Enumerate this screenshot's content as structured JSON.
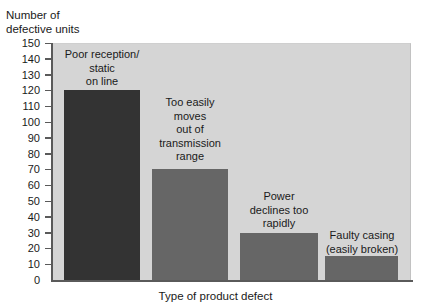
{
  "chart_data": {
    "type": "bar",
    "title": "",
    "xlabel": "Type of product defect",
    "ylabel": "Number of\ndefective units",
    "categories": [
      "Poor reception/\nstatic\non line",
      "Too easily\nmoves\nout of\ntransmission\nrange",
      "Power\ndeclines too\nrapidly",
      "Faulty casing\n(easily broken)"
    ],
    "values": [
      120,
      70,
      30,
      15
    ],
    "ylim": [
      0,
      150
    ],
    "ytick_step": 10,
    "yticks": [
      0,
      10,
      20,
      30,
      40,
      50,
      60,
      70,
      80,
      90,
      100,
      110,
      120,
      130,
      140,
      150
    ],
    "ytick_labels": [
      "0",
      "10",
      "20",
      "30",
      "40",
      "50",
      "60",
      "70",
      "80",
      "90",
      "100",
      "110",
      "120",
      "130",
      "140",
      "150"
    ],
    "grid": false,
    "legend": false,
    "bar_colors": [
      "#333333",
      "#666666",
      "#666666",
      "#666666"
    ],
    "plot_background": "#d5d5d5",
    "axis_color": "#5a5a5a"
  },
  "bars": [
    {
      "category": "Poor reception/\nstatic\non line",
      "value": 120,
      "color": "#333333",
      "left_px": 64,
      "width_px": 76,
      "label_left_px": 56,
      "label_top_px": 48,
      "label_width_px": 92
    },
    {
      "category": "Too easily\nmoves\nout of\ntransmission\nrange",
      "value": 70,
      "color": "#666666",
      "left_px": 152,
      "width_px": 76,
      "label_left_px": 144,
      "label_top_px": 96,
      "label_width_px": 92
    },
    {
      "category": "Power\ndeclines too\nrapidly",
      "value": 30,
      "color": "#666666",
      "left_px": 240,
      "width_px": 78,
      "label_left_px": 232,
      "label_top_px": 190,
      "label_width_px": 94
    },
    {
      "category": "Faulty casing\n(easily broken)",
      "value": 15,
      "color": "#666666",
      "left_px": 325,
      "width_px": 73,
      "label_left_px": 312,
      "label_top_px": 229,
      "label_width_px": 100
    }
  ]
}
